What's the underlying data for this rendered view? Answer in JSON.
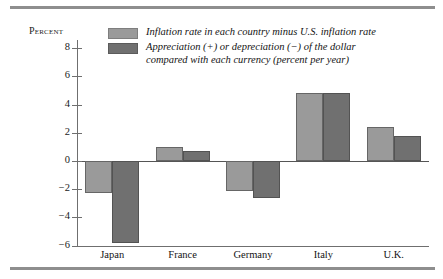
{
  "chart_data": {
    "type": "bar",
    "title": "",
    "ylabel": "Percent",
    "xlabel": "",
    "ylim": [
      -6,
      8
    ],
    "yticks": [
      8,
      6,
      4,
      2,
      0,
      -2,
      -4,
      -6
    ],
    "ytick_labels": [
      "8",
      "6",
      "4",
      "2",
      "0",
      "−2",
      "−4",
      "−6"
    ],
    "grid": false,
    "legend_position": "top-center",
    "categories": [
      "Japan",
      "France",
      "Germany",
      "Italy",
      "U.K."
    ],
    "series": [
      {
        "name": "Inflation rate in each country minus U.S. inflation rate",
        "color": "#9a9a9a",
        "values": [
          -2.3,
          1.0,
          -2.1,
          4.8,
          2.4
        ]
      },
      {
        "name": "Appreciation (+) or depreciation (−) of the dollar\ncompared with each currency (percent per year)",
        "color": "#707070",
        "values": [
          -5.8,
          0.7,
          -2.6,
          4.8,
          1.8
        ]
      }
    ]
  },
  "colors": {
    "series_light": "#9a9a9a",
    "series_dark": "#707070",
    "axis": "#6f6f6f",
    "rule": "#8e8e8e",
    "background": "#ffffff"
  }
}
